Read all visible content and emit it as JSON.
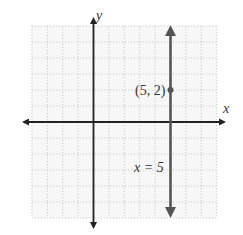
{
  "chart_data": {
    "type": "line",
    "title": "",
    "xlabel": "x",
    "ylabel": "y",
    "xlim": [
      -4,
      8
    ],
    "ylim": [
      -6,
      6
    ],
    "grid": true,
    "grid_style": "dotted",
    "series": [
      {
        "name": "x = 5",
        "kind": "vertical-line",
        "x": 5,
        "arrows": "both",
        "color": "#555555"
      }
    ],
    "points": [
      {
        "x": 5,
        "y": 2,
        "label": "(5, 2)"
      }
    ],
    "annotations": [
      {
        "text": "x = 5",
        "near": "vertical line, below x-axis"
      }
    ]
  },
  "labels": {
    "x_axis": "x",
    "y_axis": "y",
    "point": "(5, 2)",
    "line": "x = 5"
  },
  "colors": {
    "axis": "#222222",
    "line": "#555555",
    "grid": "#bfbfbf",
    "grid_bg": "#f7f7f7"
  }
}
